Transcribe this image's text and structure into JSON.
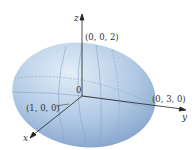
{
  "diagram": {
    "axes": {
      "x": "x",
      "y": "y",
      "z": "z"
    },
    "origin_label": "0",
    "points": {
      "z_intercept": "(0, 0, 2)",
      "x_intercept": "(1, 0, 0)",
      "y_intercept": "(0, 3, 0)"
    },
    "colors": {
      "surface_light": "#dce8f4",
      "surface_mid": "#a9c3e0",
      "surface_dark": "#7c9fc9",
      "grid_lines": "#8aa6c6",
      "axis": "#222222"
    }
  }
}
